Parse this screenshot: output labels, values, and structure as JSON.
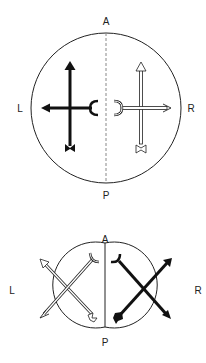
{
  "figure_top": {
    "labels": {
      "anterior": "A",
      "posterior": "P",
      "left": "L",
      "right": "R"
    },
    "description": "Single circle divided by dashed midline; black cross arrows on left half, white (outlined) cross arrows on right half"
  },
  "figure_bottom": {
    "labels": {
      "anterior": "A",
      "posterior": "P",
      "left": "L",
      "right": "R"
    },
    "description": "Two adjoining circles; white (outlined) diagonal crossed arrows in left circle, black diagonal crossed arrows in right circle"
  },
  "colors": {
    "line": "#222222",
    "fill_dark": "#111111",
    "fill_light": "#ffffff",
    "dashed": "#888888"
  }
}
